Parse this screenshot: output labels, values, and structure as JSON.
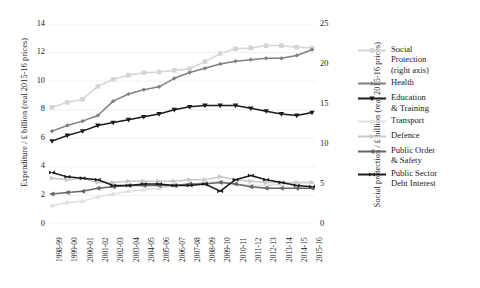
{
  "chart_data": {
    "type": "line",
    "title": "",
    "xlabel": "",
    "ylabel": "Expenditure / £ billion (real 2015-16 prices)",
    "y2label": "Social protection / £ billion (real 2015-16 prices)",
    "grid": true,
    "legend_position": "right",
    "ylim": [
      0,
      14
    ],
    "yticks": [
      "0",
      "2",
      "4",
      "6",
      "8",
      "10",
      "12",
      "14"
    ],
    "y2lim": [
      0,
      25
    ],
    "y2ticks": [
      "0",
      "5",
      "10",
      "15",
      "20",
      "25"
    ],
    "categories": [
      "1998-99",
      "1999-00",
      "2000-01",
      "2001-02",
      "2002-03",
      "2003-04",
      "2004-05",
      "2005-06",
      "2006-07",
      "2007-08",
      "2008-09",
      "2009-10",
      "2010-11",
      "2011-12",
      "2012-13",
      "2013-14",
      "2014-15",
      "2015-16"
    ],
    "series": [
      {
        "name": "Social Protection (right axis)",
        "axis": "right",
        "color": "#d4d4d4",
        "marker": "square",
        "values": [
          14.6,
          15.2,
          15.6,
          17.2,
          18.1,
          18.6,
          18.9,
          19.0,
          19.2,
          19.4,
          20.3,
          21.3,
          21.9,
          22.0,
          22.3,
          22.3,
          22.1,
          22.0
        ]
      },
      {
        "name": "Health",
        "axis": "left",
        "color": "#808080",
        "marker": "diamond",
        "values": [
          6.5,
          6.9,
          7.2,
          7.6,
          8.6,
          9.1,
          9.4,
          9.6,
          10.2,
          10.6,
          10.9,
          11.2,
          11.4,
          11.5,
          11.6,
          11.6,
          11.8,
          12.2
        ]
      },
      {
        "name": "Education & Training",
        "axis": "left",
        "color": "#1a1a1a",
        "marker": "triangle-down",
        "values": [
          5.8,
          6.2,
          6.5,
          6.9,
          7.1,
          7.3,
          7.5,
          7.7,
          8.0,
          8.2,
          8.3,
          8.3,
          8.3,
          8.1,
          7.9,
          7.7,
          7.6,
          7.8
        ]
      },
      {
        "name": "Transport",
        "axis": "left",
        "color": "#e0e0e0",
        "marker": "triangle-up",
        "values": [
          1.3,
          1.5,
          1.6,
          1.9,
          2.1,
          2.3,
          2.4,
          2.5,
          2.7,
          2.8,
          2.9,
          3.0,
          2.8,
          2.7,
          2.7,
          2.8,
          2.9,
          2.9
        ]
      },
      {
        "name": "Defence",
        "axis": "left",
        "color": "#c8c8c8",
        "marker": "triangle-right",
        "values": [
          3.2,
          3.1,
          3.2,
          2.9,
          2.9,
          3.0,
          3.0,
          3.0,
          3.0,
          3.1,
          3.1,
          3.3,
          3.1,
          3.0,
          2.9,
          2.9,
          2.9,
          2.9
        ]
      },
      {
        "name": "Public Order & Safety",
        "axis": "left",
        "color": "#666666",
        "marker": "triangle-left",
        "values": [
          2.1,
          2.2,
          2.3,
          2.5,
          2.6,
          2.7,
          2.7,
          2.7,
          2.7,
          2.8,
          2.8,
          2.9,
          2.8,
          2.6,
          2.5,
          2.5,
          2.5,
          2.5
        ]
      },
      {
        "name": "Public Sector Debt Interest",
        "axis": "left",
        "color": "#1a1a1a",
        "marker": "cross",
        "values": [
          3.6,
          3.3,
          3.2,
          3.1,
          2.7,
          2.7,
          2.8,
          2.8,
          2.7,
          2.7,
          2.8,
          2.3,
          3.1,
          3.4,
          3.1,
          2.9,
          2.7,
          2.6
        ]
      }
    ]
  },
  "legend": {
    "items": [
      {
        "label": "Social",
        "sub1": "Protection",
        "sub2": "(right axis)"
      },
      {
        "label": "Health",
        "sub1": "",
        "sub2": ""
      },
      {
        "label": "Education",
        "sub1": "& Training",
        "sub2": ""
      },
      {
        "label": "Transport",
        "sub1": "",
        "sub2": ""
      },
      {
        "label": "Defence",
        "sub1": "",
        "sub2": ""
      },
      {
        "label": "Public Order",
        "sub1": "& Safety",
        "sub2": ""
      },
      {
        "label": "Public Sector",
        "sub1": "Debt Interest",
        "sub2": ""
      }
    ]
  }
}
